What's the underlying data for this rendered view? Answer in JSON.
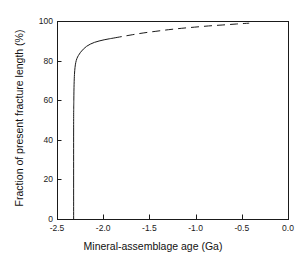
{
  "chart_data": {
    "type": "line",
    "title": "",
    "xlabel": "Mineral-assemblage age (Ga)",
    "ylabel": "Fraction of present fracture length (%)",
    "xlim": [
      -2.5,
      0.0
    ],
    "ylim": [
      0,
      100
    ],
    "xticks": [
      -2.5,
      -2.0,
      -1.5,
      -1.0,
      -0.5,
      0.0
    ],
    "xtick_labels": [
      "-2.5",
      "-2.0",
      "-1.5",
      "-1.0",
      "-0.5",
      "0.0"
    ],
    "yticks": [
      0,
      20,
      40,
      60,
      80,
      100
    ],
    "ytick_labels": [
      "0",
      "20",
      "40",
      "60",
      "80",
      "100"
    ],
    "grid": false,
    "legend": null,
    "line_color": "#1a1a1a",
    "background_color": "#ffffff",
    "series": [
      {
        "name": "cumulative-fracture-length-solid",
        "style": "solid",
        "x": [
          -2.32,
          -2.32,
          -2.318,
          -2.315,
          -2.311,
          -2.305,
          -2.297,
          -2.285,
          -2.268,
          -2.245,
          -2.215,
          -2.18,
          -2.14,
          -2.095,
          -2.045,
          -1.99,
          -1.935,
          -1.885
        ],
        "values": [
          0.0,
          46.0,
          60.0,
          68.0,
          73.0,
          76.5,
          79.0,
          81.0,
          82.6,
          84.2,
          85.8,
          87.2,
          88.3,
          89.2,
          89.9,
          90.5,
          91.0,
          91.4
        ]
      },
      {
        "name": "cumulative-fracture-length-dashed",
        "style": "dashed",
        "x": [
          -1.885,
          -1.79,
          -1.68,
          -1.56,
          -1.43,
          -1.295,
          -1.155,
          -1.01,
          -0.86,
          -0.705,
          -0.555,
          -0.42
        ],
        "values": [
          91.4,
          92.2,
          93.1,
          94.0,
          94.8,
          95.6,
          96.3,
          96.9,
          97.5,
          98.0,
          98.5,
          98.9
        ]
      }
    ]
  },
  "figure": {
    "frame_left_px": 57,
    "frame_right_px": 288,
    "frame_top_px": 21,
    "frame_bottom_px": 219
  }
}
